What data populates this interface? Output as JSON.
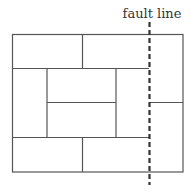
{
  "diagram": {
    "fault_label": "fault line",
    "colors": {
      "lines": "#555555",
      "fault": "#333333",
      "text": "#333333",
      "background": "#ffffff"
    }
  }
}
